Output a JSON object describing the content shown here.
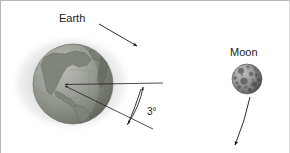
{
  "figure": {
    "background_color": "#ffffff",
    "border_color": "#b8b8b8",
    "width": 290,
    "height": 153
  },
  "labels": {
    "earth": "Earth",
    "moon": "Moon",
    "angle": "3°"
  },
  "earth": {
    "name": "earth-globe",
    "center_x": 72,
    "center_y": 83,
    "radius": 40,
    "ocean_color": "#9a9e98",
    "land_color": "#7e8478",
    "outline_color": "#6d726a",
    "halo_color": "#d5d5d5",
    "halo_rx": 62,
    "halo_ry": 50,
    "halo_cx": 70,
    "halo_cy": 82
  },
  "moon": {
    "name": "moon-globe",
    "center_x": 246,
    "center_y": 78,
    "radius": 15,
    "base_color": "#8e8e8e",
    "crater_color": "#4a4a4a",
    "highlight_color": "#c9c9c9"
  },
  "earth_arrow": {
    "name": "earth-leader-arrow",
    "x1": 98,
    "y1": 23,
    "x2": 137,
    "y2": 46,
    "color": "#141414"
  },
  "moon_arrow": {
    "name": "moon-motion-arrow",
    "x1": 248,
    "y1": 96,
    "x2": 233,
    "y2": 146,
    "color": "#141414"
  },
  "angle": {
    "name": "tilt-angle",
    "value": "3°",
    "vertex_x": 62,
    "vertex_y": 84,
    "ray_upper_x": 162,
    "ray_upper_y": 82,
    "ray_lower_x": 152,
    "ray_lower_y": 128,
    "arc_start_x": 143,
    "arc_start_y": 82,
    "arc_end_x": 127,
    "arc_end_y": 124,
    "label_x": 146,
    "label_y": 113,
    "color": "#202020"
  },
  "label_positions": {
    "earth_x": 58,
    "earth_y": 21,
    "moon_x": 229,
    "moon_y": 55
  }
}
